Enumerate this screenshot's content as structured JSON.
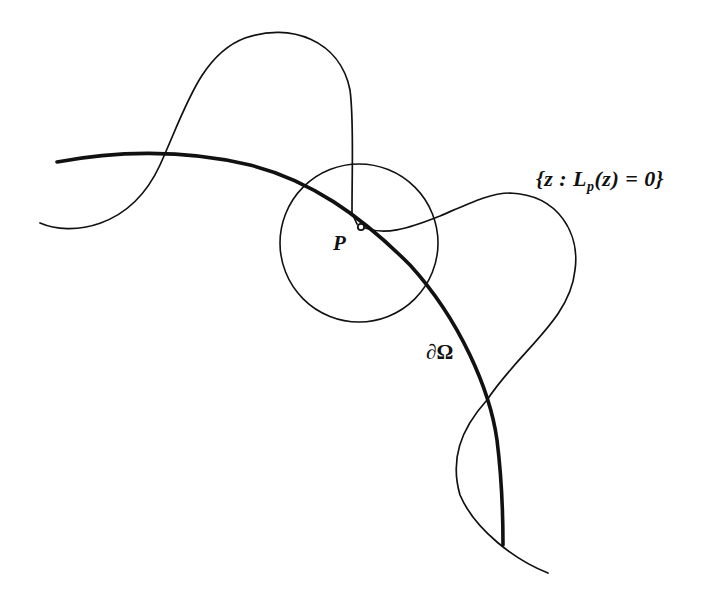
{
  "figure": {
    "labels": {
      "level_set": "{z : Lp(z) = 0}",
      "level_set_parts": {
        "open": "{z : L",
        "subscript": "p",
        "close": "(z) = 0}"
      },
      "point": "P",
      "boundary": "∂Ω"
    },
    "elements": [
      {
        "name": "boundary-curve",
        "description": "thick arc representing the boundary ∂Ω"
      },
      {
        "name": "circle",
        "description": "thin circle centered near P"
      },
      {
        "name": "level-set-curve",
        "description": "thin wavy curve {z : Lp(z) = 0} passing through P"
      },
      {
        "name": "point-p",
        "description": "small open dot marking P on the boundary"
      }
    ],
    "colors": {
      "stroke": "#111111",
      "background": "#ffffff"
    }
  }
}
